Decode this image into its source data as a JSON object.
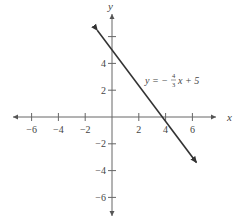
{
  "chart_data": {
    "type": "line",
    "title": "",
    "xlabel": "x",
    "ylabel": "y",
    "xlim": [
      -7.5,
      7.5
    ],
    "ylim": [
      -7.5,
      7.5
    ],
    "x_ticks": [
      -6,
      -4,
      -2,
      2,
      4,
      6
    ],
    "y_ticks": [
      -6,
      -4,
      -2,
      2,
      4
    ],
    "x_tick_labels": [
      "−6",
      "−4",
      "−2",
      "2",
      "4",
      "6"
    ],
    "y_tick_labels": [
      "−6",
      "−4",
      "−2",
      "2",
      "4"
    ],
    "grid": false,
    "series": [
      {
        "name": "y = −4/3 x + 5",
        "slope": -1.3333,
        "intercept": 5,
        "x": [
          -1.1,
          6.3
        ],
        "y": [
          6.47,
          -3.4
        ],
        "arrows": "both"
      }
    ],
    "annotations": [
      {
        "text": "y = −",
        "frac_num": "4",
        "frac_den": "3",
        "rest": "x + 5",
        "x": 3.9,
        "y": 2.7
      }
    ]
  }
}
